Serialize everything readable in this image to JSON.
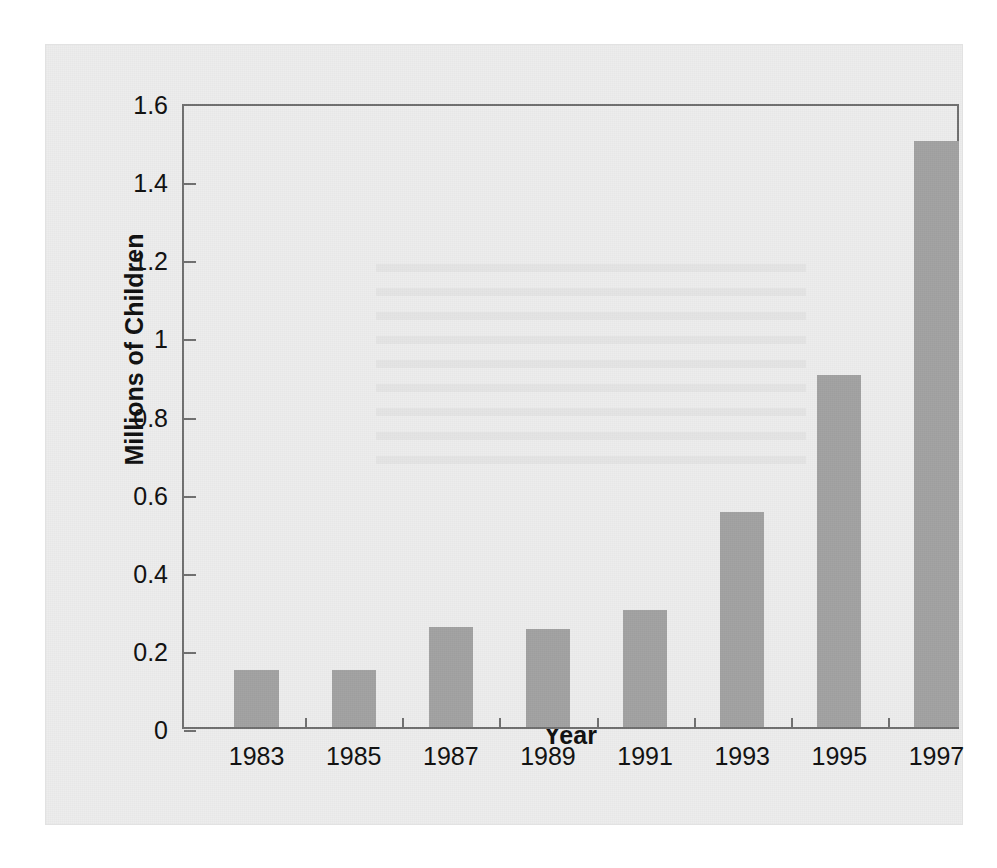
{
  "chart_data": {
    "type": "bar",
    "title": "",
    "xlabel": "Year",
    "ylabel": "Millions of Children",
    "categories": [
      "1983",
      "1985",
      "1987",
      "1989",
      "1991",
      "1993",
      "1995",
      "1997"
    ],
    "values": [
      0.145,
      0.145,
      0.255,
      0.25,
      0.3,
      0.55,
      0.9,
      1.5
    ],
    "ylim": [
      0,
      1.6
    ],
    "yticks": [
      0,
      0.2,
      0.4,
      0.6,
      0.8,
      1,
      1.2,
      1.4,
      1.6
    ],
    "ytick_labels": [
      "0",
      "0.2",
      "0.4",
      "0.6",
      "0.8",
      "1",
      "1.2",
      "1.4",
      "1.6"
    ],
    "grid": false,
    "legend": null,
    "series": [
      {
        "name": "Millions of Children",
        "values": [
          0.145,
          0.145,
          0.255,
          0.25,
          0.3,
          0.55,
          0.9,
          1.5
        ]
      }
    ],
    "annotations": []
  },
  "style": {
    "bar_color": "#a2a2a2",
    "axis_color": "#6f6f6f",
    "text_color": "#101010",
    "page_background": "#ffffff",
    "card_background": "#ededed"
  }
}
